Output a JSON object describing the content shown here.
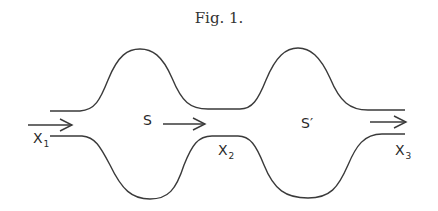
{
  "figure": {
    "title": "Fig. 1.",
    "labels": {
      "s": "S",
      "s_prime": "S′",
      "x1": {
        "base": "X",
        "sub": "1"
      },
      "x2": {
        "base": "X",
        "sub": "2"
      },
      "x3": {
        "base": "X",
        "sub": "3"
      }
    },
    "stroke_color": "#3a3a3a"
  }
}
